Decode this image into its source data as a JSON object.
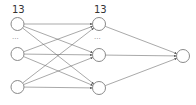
{
  "diagram": {
    "type": "neural-network",
    "layers": [
      {
        "name": "input",
        "count_label": "13",
        "ellipsis": "...",
        "nodes": [
          {
            "x": 17.5,
            "y": 24
          },
          {
            "x": 17.5,
            "y": 54
          },
          {
            "x": 17.5,
            "y": 87
          }
        ],
        "label_pos": {
          "x": 12,
          "y": 13
        },
        "ellipsis_pos": {
          "x": 12,
          "y": 39
        }
      },
      {
        "name": "hidden",
        "count_label": "13",
        "ellipsis": "...",
        "nodes": [
          {
            "x": 99,
            "y": 24
          },
          {
            "x": 99,
            "y": 55
          },
          {
            "x": 99,
            "y": 88
          }
        ],
        "label_pos": {
          "x": 94,
          "y": 13
        },
        "ellipsis_pos": {
          "x": 94,
          "y": 39
        }
      },
      {
        "name": "output",
        "count_label": "",
        "ellipsis": "",
        "nodes": [
          {
            "x": 183,
            "y": 56
          }
        ]
      }
    ],
    "node_radius": 6.5,
    "connections": "fully-connected",
    "colors": {
      "node_stroke": "#8a8a8a",
      "edge": "#6e6e6e",
      "label": "#333333"
    }
  }
}
